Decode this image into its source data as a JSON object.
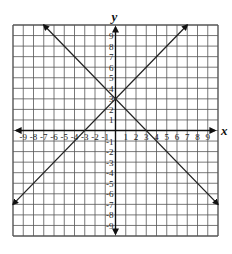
{
  "chart_data": {
    "type": "line",
    "title": "",
    "xlabel": "x",
    "ylabel": "y",
    "xlim": [
      -10,
      10
    ],
    "ylim": [
      -10,
      10
    ],
    "grid": true,
    "x_ticks": [
      -9,
      -8,
      -7,
      -6,
      -5,
      -4,
      -3,
      -2,
      -1,
      1,
      2,
      3,
      4,
      5,
      6,
      7,
      8,
      9
    ],
    "y_ticks": [
      -9,
      -8,
      -7,
      -6,
      -5,
      -4,
      -3,
      -2,
      -1,
      1,
      2,
      3,
      4,
      5,
      6,
      7,
      8,
      9
    ],
    "series": [
      {
        "name": "y = x + 3",
        "x": [
          -10,
          7
        ],
        "y": [
          -7,
          10
        ],
        "arrows": true,
        "color": "#222222"
      },
      {
        "name": "y = -x + 3",
        "x": [
          -7,
          10
        ],
        "y": [
          10,
          -7
        ],
        "arrows": true,
        "color": "#222222"
      }
    ],
    "intersection": {
      "x": 0,
      "y": 3
    }
  },
  "style": {
    "grid_color": "#555555",
    "axis_color": "#111111",
    "background": "#ffffff"
  }
}
